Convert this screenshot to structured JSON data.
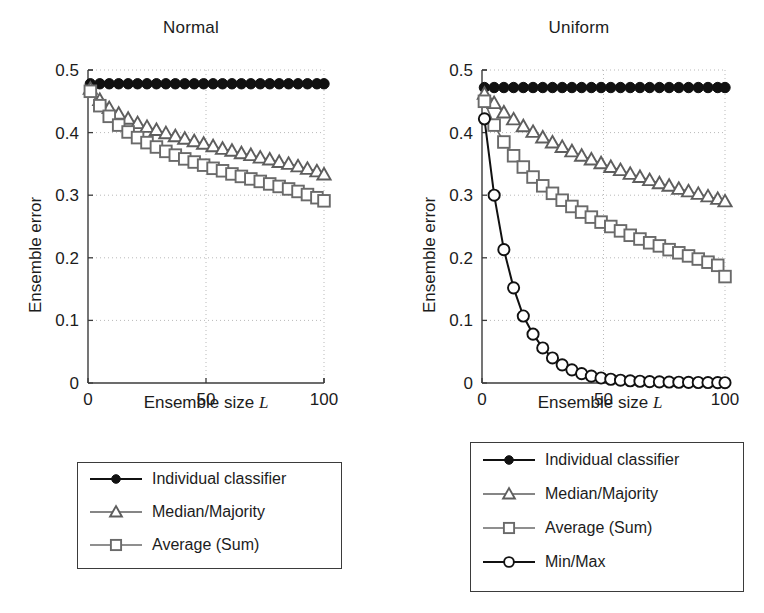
{
  "figure": {
    "width": 764,
    "height": 613,
    "background": "#ffffff"
  },
  "chart_data": [
    {
      "type": "line",
      "title": "Normal",
      "xlabel": "Ensemble size L",
      "ylabel": "Ensemble error",
      "xlim": [
        0,
        100
      ],
      "ylim": [
        0,
        0.5
      ],
      "xticks": [
        0,
        50,
        100
      ],
      "xticklabels": [
        "0",
        "50",
        "100"
      ],
      "yticks": [
        0,
        0.1,
        0.2,
        0.3,
        0.4,
        0.5
      ],
      "yticklabels": [
        "0",
        "0.1",
        "0.2",
        "0.3",
        "0.4",
        "0.5"
      ],
      "grid": true,
      "grid_style": "dotted",
      "legend_position": "below-plot",
      "x": [
        1,
        5,
        9,
        13,
        17,
        21,
        25,
        29,
        33,
        37,
        41,
        45,
        49,
        53,
        57,
        61,
        65,
        69,
        73,
        77,
        81,
        85,
        89,
        93,
        97,
        100
      ],
      "series": [
        {
          "name": "Individual classifier",
          "marker": "filled-circle",
          "color": "#111111",
          "values": [
            0.478,
            0.478,
            0.478,
            0.478,
            0.478,
            0.478,
            0.478,
            0.478,
            0.478,
            0.478,
            0.478,
            0.478,
            0.478,
            0.478,
            0.478,
            0.478,
            0.478,
            0.478,
            0.478,
            0.478,
            0.478,
            0.478,
            0.478,
            0.478,
            0.478,
            0.478
          ]
        },
        {
          "name": "Median/Majority",
          "marker": "triangle",
          "color": "#5e5e5e",
          "values": [
            0.47,
            0.452,
            0.439,
            0.43,
            0.422,
            0.415,
            0.409,
            0.404,
            0.399,
            0.394,
            0.39,
            0.386,
            0.382,
            0.378,
            0.374,
            0.371,
            0.367,
            0.364,
            0.36,
            0.357,
            0.353,
            0.35,
            0.346,
            0.342,
            0.338,
            0.333
          ]
        },
        {
          "name": "Average (Sum)",
          "marker": "square",
          "color": "#6a6a6a",
          "values": [
            0.466,
            0.443,
            0.426,
            0.412,
            0.401,
            0.392,
            0.384,
            0.377,
            0.37,
            0.364,
            0.358,
            0.353,
            0.348,
            0.343,
            0.339,
            0.334,
            0.33,
            0.326,
            0.322,
            0.318,
            0.314,
            0.31,
            0.306,
            0.301,
            0.296,
            0.291
          ]
        }
      ]
    },
    {
      "type": "line",
      "title": "Uniform",
      "xlabel": "Ensemble size L",
      "ylabel": "Ensemble error",
      "xlim": [
        0,
        100
      ],
      "ylim": [
        0,
        0.5
      ],
      "xticks": [
        0,
        50,
        100
      ],
      "xticklabels": [
        "0",
        "50",
        "100"
      ],
      "yticks": [
        0,
        0.1,
        0.2,
        0.3,
        0.4,
        0.5
      ],
      "yticklabels": [
        "0",
        "0.1",
        "0.2",
        "0.3",
        "0.4",
        "0.5"
      ],
      "grid": true,
      "grid_style": "dotted",
      "legend_position": "below-plot",
      "x": [
        1,
        5,
        9,
        13,
        17,
        21,
        25,
        29,
        33,
        37,
        41,
        45,
        49,
        53,
        57,
        61,
        65,
        69,
        73,
        77,
        81,
        85,
        89,
        93,
        97,
        100
      ],
      "series": [
        {
          "name": "Individual classifier",
          "marker": "filled-circle",
          "color": "#111111",
          "values": [
            0.472,
            0.472,
            0.472,
            0.472,
            0.472,
            0.472,
            0.472,
            0.472,
            0.472,
            0.472,
            0.472,
            0.472,
            0.472,
            0.472,
            0.472,
            0.472,
            0.472,
            0.472,
            0.472,
            0.472,
            0.472,
            0.472,
            0.472,
            0.472,
            0.472,
            0.472
          ]
        },
        {
          "name": "Median/Majority",
          "marker": "triangle",
          "color": "#5e5e5e",
          "values": [
            0.462,
            0.447,
            0.432,
            0.421,
            0.41,
            0.401,
            0.392,
            0.384,
            0.377,
            0.37,
            0.363,
            0.357,
            0.351,
            0.345,
            0.34,
            0.334,
            0.329,
            0.324,
            0.319,
            0.315,
            0.31,
            0.306,
            0.302,
            0.298,
            0.294,
            0.29
          ]
        },
        {
          "name": "Average (Sum)",
          "marker": "square",
          "color": "#6a6a6a",
          "values": [
            0.45,
            0.412,
            0.385,
            0.363,
            0.345,
            0.329,
            0.315,
            0.303,
            0.292,
            0.282,
            0.273,
            0.265,
            0.257,
            0.25,
            0.243,
            0.236,
            0.23,
            0.224,
            0.219,
            0.213,
            0.208,
            0.203,
            0.198,
            0.193,
            0.188,
            0.17
          ]
        },
        {
          "name": "Min/Max",
          "marker": "open-circle",
          "color": "#111111",
          "values": [
            0.422,
            0.3,
            0.213,
            0.152,
            0.107,
            0.078,
            0.056,
            0.04,
            0.029,
            0.021,
            0.015,
            0.011,
            0.008,
            0.006,
            0.0045,
            0.0035,
            0.0028,
            0.0022,
            0.0018,
            0.0015,
            0.0012,
            0.001,
            0.0008,
            0.0007,
            0.0006,
            0.0005
          ]
        }
      ]
    }
  ],
  "legends": [
    {
      "id": "legend-normal",
      "items": [
        {
          "label": "Individual classifier",
          "marker": "filled-circle",
          "color": "#111111"
        },
        {
          "label": "Median/Majority",
          "marker": "triangle",
          "color": "#5e5e5e"
        },
        {
          "label": "Average (Sum)",
          "marker": "square",
          "color": "#6a6a6a"
        }
      ]
    },
    {
      "id": "legend-uniform",
      "items": [
        {
          "label": "Individual classifier",
          "marker": "filled-circle",
          "color": "#111111"
        },
        {
          "label": "Median/Majority",
          "marker": "triangle",
          "color": "#5e5e5e"
        },
        {
          "label": "Average (Sum)",
          "marker": "square",
          "color": "#6a6a6a"
        },
        {
          "label": "Min/Max",
          "marker": "open-circle",
          "color": "#111111"
        }
      ]
    }
  ],
  "colors": {
    "axis": "#3b3b3b",
    "grid": "#b9b9b9",
    "text": "#1c1c1c",
    "background": "#ffffff"
  }
}
